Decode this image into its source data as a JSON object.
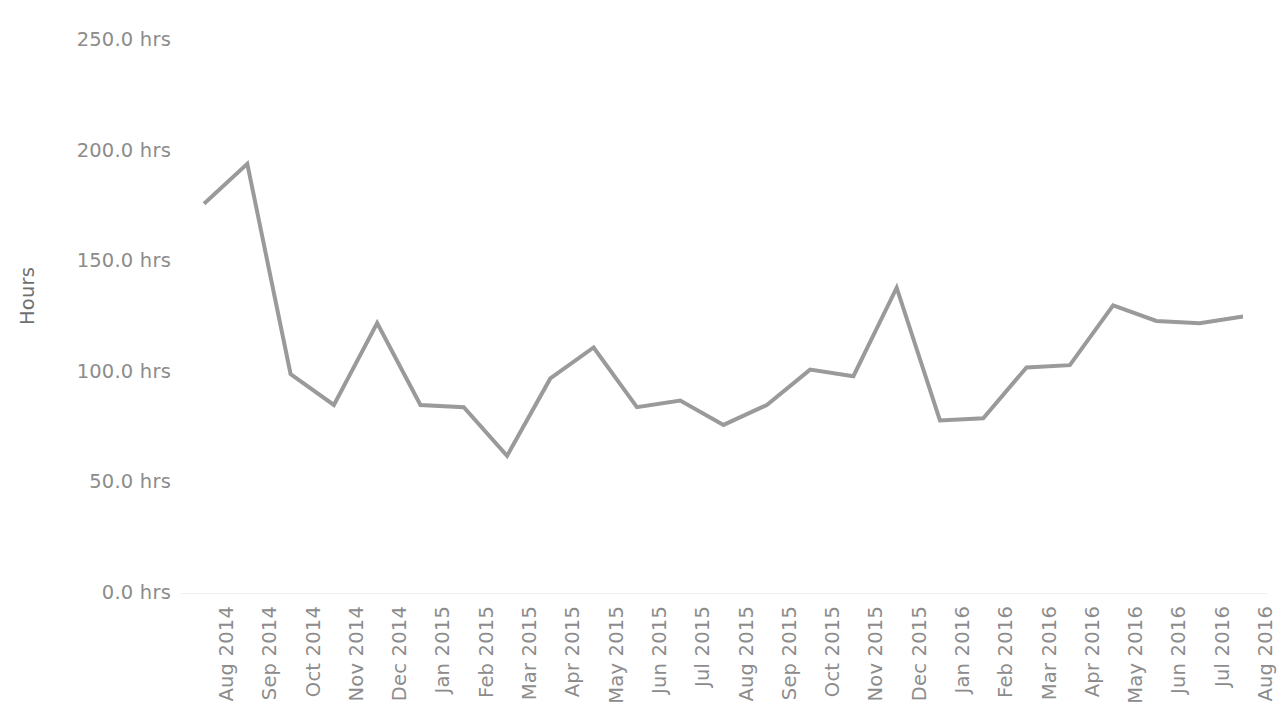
{
  "chart_data": {
    "type": "line",
    "title": "",
    "subtitle": "",
    "xlabel": "",
    "ylabel": "Hours",
    "categories": [
      "Aug 2014",
      "Sep 2014",
      "Oct 2014",
      "Nov 2014",
      "Dec 2014",
      "Jan 2015",
      "Feb 2015",
      "Mar 2015",
      "Apr 2015",
      "May 2015",
      "Jun 2015",
      "Jul 2015",
      "Aug 2015",
      "Sep 2015",
      "Oct 2015",
      "Nov 2015",
      "Dec 2015",
      "Jan 2016",
      "Feb 2016",
      "Mar 2016",
      "Apr 2016",
      "May 2016",
      "Jun 2016",
      "Jul 2016",
      "Aug 2016"
    ],
    "values": [
      176,
      194,
      99,
      85,
      122,
      85,
      84,
      62,
      97,
      111,
      84,
      87,
      76,
      85,
      101,
      98,
      138,
      78,
      79,
      102,
      103,
      130,
      123,
      122,
      125
    ],
    "series": [
      {
        "name": "Hours",
        "color": "#9a9a9a",
        "values": [
          176,
          194,
          99,
          85,
          122,
          85,
          84,
          62,
          97,
          111,
          84,
          87,
          76,
          85,
          101,
          98,
          138,
          78,
          79,
          102,
          103,
          130,
          123,
          122,
          125
        ]
      }
    ],
    "ylim": [
      0,
      250
    ],
    "ytick_values": [
      0,
      50,
      100,
      150,
      200,
      250
    ],
    "ytick_labels": [
      "0.0 hrs",
      "50.0 hrs",
      "100.0 hrs",
      "150.0 hrs",
      "200.0 hrs",
      "250.0 hrs"
    ],
    "grid": false,
    "legend": "none",
    "xtick_rotation": -90,
    "line_width": 4,
    "colors": {
      "line": "#9a9a9a",
      "tick_label": "#8c8c8c",
      "axis_title": "#6f6f6f",
      "background": "#ffffff",
      "baseline": "#f0f0f0"
    }
  }
}
